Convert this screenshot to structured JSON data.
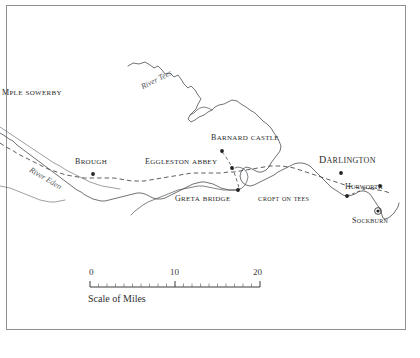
{
  "map": {
    "title": "Map of the River Tees and River Eden district",
    "background_color": "#ffffff",
    "frame_color": "#8d9296",
    "ink_color": "#4a4e52",
    "label_color": "#2a2a2a",
    "places": [
      {
        "name": "temple-sowerby",
        "label": "MPLE SOWERBY",
        "x": 2,
        "y": 91,
        "size": 9.5,
        "marker": "none"
      },
      {
        "name": "brough",
        "label": "Brough",
        "x": 75,
        "y": 160,
        "size": 9.5,
        "marker": "dot",
        "marker_x": 93,
        "marker_y": 174
      },
      {
        "name": "eggleston-abbey",
        "label": "Eggleston Abbey",
        "x": 145,
        "y": 160,
        "size": 9.5,
        "marker": "dot",
        "marker_x": 232,
        "marker_y": 168
      },
      {
        "name": "barnard-castle",
        "label": "Barnard Castle",
        "x": 211,
        "y": 136,
        "size": 9.5,
        "marker": "dot",
        "marker_x": 222,
        "marker_y": 151
      },
      {
        "name": "greta-bridge",
        "label": "Greta Bridge",
        "x": 175,
        "y": 197,
        "size": 9.5,
        "marker": "dot",
        "marker_x": 238,
        "marker_y": 190
      },
      {
        "name": "darlington",
        "label": "Darlington",
        "x": 319,
        "y": 157,
        "size": 11.5,
        "marker": "dot",
        "marker_x": 341,
        "marker_y": 173
      },
      {
        "name": "croft-on-tees",
        "label": "Croft on Tees",
        "x": 258,
        "y": 198,
        "size": 8.5,
        "marker": "dot",
        "marker_x": 347,
        "marker_y": 196
      },
      {
        "name": "hurworth",
        "label": "Hurworth",
        "x": 345,
        "y": 185,
        "size": 9,
        "marker": "dot",
        "marker_x": 380,
        "marker_y": 186
      },
      {
        "name": "sockburn",
        "label": "Sockburn",
        "x": 352,
        "y": 219,
        "size": 9,
        "marker": "circled-dot",
        "marker_x": 378,
        "marker_y": 211
      }
    ],
    "rivers": [
      {
        "name": "river-tees",
        "label": "River Tees",
        "x": 140,
        "y": 84,
        "rotation": -27
      },
      {
        "name": "river-eden",
        "label": "River Eden",
        "x": 32,
        "y": 166,
        "rotation": 31
      }
    ],
    "scale": {
      "caption": "Scale of Miles",
      "caption_x": 88,
      "caption_y": 294,
      "bar_x": 90,
      "bar_y": 287,
      "bar_width": 170,
      "labels": [
        {
          "text": "0",
          "x": 89,
          "y": 271
        },
        {
          "text": "10",
          "x": 170,
          "y": 271
        },
        {
          "text": "20",
          "x": 253,
          "y": 271
        }
      ],
      "major_ticks": [
        0,
        10,
        20
      ],
      "minor_tick_count": 20,
      "units": "miles",
      "min": 0,
      "max": 20
    }
  }
}
